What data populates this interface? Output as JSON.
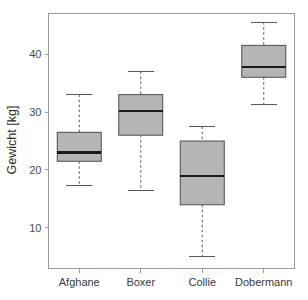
{
  "chart_data": {
    "type": "box",
    "title": "",
    "xlabel": "",
    "ylabel": "Gewicht [kg]",
    "categories": [
      "Afghane",
      "Boxer",
      "Collie",
      "Dobermann"
    ],
    "ylim": [
      3,
      47
    ],
    "yticks": [
      10,
      20,
      30,
      40
    ],
    "ytick_labels": [
      "10",
      "20",
      "30",
      "40"
    ],
    "grid": false,
    "legend": "none",
    "boxes": [
      {
        "name": "Afghane",
        "whisker_low": 17.3,
        "q1": 21.5,
        "median": 23.0,
        "q3": 26.5,
        "whisker_high": 33.0
      },
      {
        "name": "Boxer",
        "whisker_low": 16.5,
        "q1": 26.0,
        "median": 30.2,
        "q3": 33.0,
        "whisker_high": 37.0
      },
      {
        "name": "Collie",
        "whisker_low": 5.0,
        "q1": 14.0,
        "median": 19.0,
        "q3": 25.0,
        "whisker_high": 27.5
      },
      {
        "name": "Dobermann",
        "whisker_low": 31.3,
        "q1": 36.0,
        "median": 37.8,
        "q3": 41.5,
        "whisker_high": 45.5
      }
    ],
    "colors": {
      "box_fill": "#b5b5b5",
      "box_stroke": "#4e4e4e",
      "median": "#1a1a1a",
      "whisker": "#5a5a5a",
      "axis": "#9a9a9a",
      "text": "#3a3a3a",
      "background": "#ffffff"
    }
  },
  "axis": {
    "y_title": "Gewicht [kg]",
    "tick_10": "10",
    "tick_20": "20",
    "tick_30": "30",
    "tick_40": "40"
  },
  "categories": {
    "c0": "Afghane",
    "c1": "Boxer",
    "c2": "Collie",
    "c3": "Dobermann"
  }
}
